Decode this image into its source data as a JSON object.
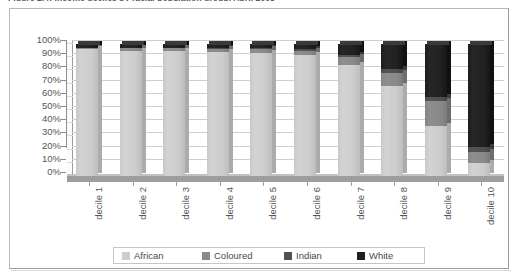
{
  "figure": {
    "caption": "Figure 2.4: Income deciles by racial population group, April 2008"
  },
  "chart_data": {
    "type": "bar",
    "stacked": true,
    "percent_stacked": true,
    "title": "",
    "subtitle": "",
    "xlabel": "",
    "ylabel": "",
    "ylim": [
      0,
      100
    ],
    "grid": true,
    "grid_axis": "y",
    "legend_position": "bottom",
    "three_d": true,
    "categories": [
      "decile 1",
      "decile 2",
      "decile 3",
      "decile 4",
      "decile 5",
      "decile 6",
      "decile 7",
      "decile 8",
      "decile 9",
      "decile 10"
    ],
    "ytick_labels": [
      "0%",
      "10%",
      "20%",
      "30%",
      "40%",
      "50%",
      "60%",
      "70%",
      "80%",
      "90%",
      "100%"
    ],
    "ytick_values": [
      0,
      10,
      20,
      30,
      40,
      50,
      60,
      70,
      80,
      90,
      100
    ],
    "series": [
      {
        "name": "African",
        "color": "#cdcdcd",
        "values": [
          96,
          95,
          95,
          94,
          93,
          92,
          84,
          68,
          38,
          10
        ]
      },
      {
        "name": "Coloured",
        "color": "#8a8a8a",
        "values": [
          1,
          2,
          2,
          2,
          3,
          3,
          6,
          10,
          19,
          8
        ]
      },
      {
        "name": "Indian",
        "color": "#505050",
        "values": [
          0,
          0,
          0,
          1,
          1,
          1,
          2,
          3,
          3,
          4
        ]
      },
      {
        "name": "White",
        "color": "#1f1f1f",
        "values": [
          3,
          3,
          3,
          3,
          3,
          4,
          8,
          19,
          40,
          78
        ]
      }
    ]
  },
  "legend": {
    "entries": [
      {
        "label": "African",
        "color": "#cdcdcd"
      },
      {
        "label": "Coloured",
        "color": "#8a8a8a"
      },
      {
        "label": "Indian",
        "color": "#505050"
      },
      {
        "label": "White",
        "color": "#1f1f1f"
      }
    ]
  }
}
